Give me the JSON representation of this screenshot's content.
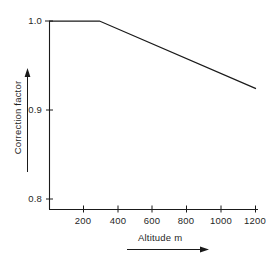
{
  "chart_data": {
    "type": "line",
    "title": "",
    "xlabel": "Altitude m",
    "ylabel": "Correction factor",
    "xlim": [
      0,
      1230
    ],
    "ylim": [
      0.8,
      1.0
    ],
    "grid": false,
    "legend": null,
    "xticks": [
      200,
      400,
      600,
      800,
      1000,
      1200
    ],
    "xtick_labels": [
      "200",
      "400",
      "600",
      "800",
      "1000",
      "1200"
    ],
    "yticks": [
      0.8,
      0.9,
      1.0
    ],
    "ytick_labels": [
      "0.8",
      "0.9",
      "1.0"
    ],
    "series": [
      {
        "name": "correction factor",
        "x": [
          0,
          300,
          1230
        ],
        "values": [
          1.0,
          1.0,
          0.928
        ]
      }
    ],
    "annotations": [
      {
        "name": "x-axis-arrow",
        "direction": "right"
      },
      {
        "name": "y-axis-arrow",
        "direction": "up"
      }
    ],
    "colors": {
      "background": "#ffffff",
      "axis": "#1a1a1a",
      "line": "#1a1a1a",
      "text": "#1f1f1f"
    }
  }
}
